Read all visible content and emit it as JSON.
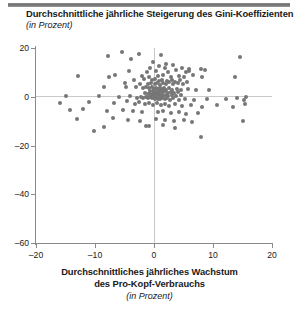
{
  "figure": {
    "title": "Durchschnittliche jährliche Steigerung des Gini-Koeffizienten",
    "subtitle": "(in Prozent)",
    "x_caption_line1": "Durchschnittliches jährliches Wachstum",
    "x_caption_line2": "des Pro-Kopf-Verbrauchs",
    "x_caption_sub": "(in Prozent)",
    "dot_color": "#767676",
    "axis_color": "#8a8a8a",
    "zero_line_color": "#c9c9c9",
    "rule_color": "#6f6f6f"
  },
  "chart_data": {
    "type": "scatter",
    "title": "Durchschnittliche jährliche Steigerung des Gini-Koeffizienten",
    "subtitle": "(in Prozent)",
    "xlabel": "Durchschnittliches jährliches Wachstum des Pro-Kopf-Verbrauchs (in Prozent)",
    "ylabel": "Durchschnittliche jährliche Steigerung des Gini-Koeffizienten (in Prozent)",
    "xlim": [
      -20,
      20
    ],
    "ylim": [
      -60,
      20
    ],
    "xticks": [
      -20,
      -10,
      0,
      10,
      20
    ],
    "yticks": [
      20,
      0,
      -20,
      -40,
      -60
    ],
    "xtick_labels": [
      "-20",
      "-10",
      "0",
      "10",
      "20"
    ],
    "ytick_labels": [
      "20",
      "0",
      "-20",
      "-40",
      "-60"
    ],
    "grid": false,
    "zero_reference_lines": {
      "x": 0,
      "y": 0
    },
    "legend": null,
    "marker": {
      "shape": "circle",
      "size": 4,
      "color": "#767676"
    },
    "n_points": 171,
    "points": [
      [
        -5.4,
        18.2
      ],
      [
        -2.6,
        17.6
      ],
      [
        -7.8,
        16.9
      ],
      [
        1.2,
        17.2
      ],
      [
        14.6,
        16.4
      ],
      [
        -3.9,
        15.4
      ],
      [
        -0.2,
        14.4
      ],
      [
        2.1,
        13.6
      ],
      [
        3.3,
        13.1
      ],
      [
        0.9,
        12.5
      ],
      [
        1.8,
        11.9
      ],
      [
        -0.6,
        11.6
      ],
      [
        4.7,
        11.8
      ],
      [
        6.0,
        11.2
      ],
      [
        7.9,
        11.4
      ],
      [
        8.6,
        11.1
      ],
      [
        -4.3,
        10.4
      ],
      [
        -1.2,
        10.2
      ],
      [
        0.3,
        10.6
      ],
      [
        2.4,
        10.3
      ],
      [
        3.8,
        10.8
      ],
      [
        5.4,
        10.1
      ],
      [
        5.9,
        10.6
      ],
      [
        -6.6,
        9.1
      ],
      [
        -12.8,
        8.4
      ],
      [
        -7.6,
        8.0
      ],
      [
        -2.0,
        8.6
      ],
      [
        -0.9,
        8.2
      ],
      [
        0.6,
        8.4
      ],
      [
        1.5,
        8.9
      ],
      [
        2.8,
        8.1
      ],
      [
        4.2,
        8.6
      ],
      [
        5.1,
        8.0
      ],
      [
        6.6,
        8.8
      ],
      [
        8.2,
        8.2
      ],
      [
        13.8,
        8.1
      ],
      [
        -3.4,
        6.9
      ],
      [
        -1.7,
        7.2
      ],
      [
        -0.4,
        6.8
      ],
      [
        0.2,
        7.4
      ],
      [
        0.8,
        6.6
      ],
      [
        1.4,
        7.0
      ],
      [
        2.2,
        6.4
      ],
      [
        3.0,
        6.9
      ],
      [
        3.6,
        6.2
      ],
      [
        4.4,
        6.7
      ],
      [
        5.6,
        6.1
      ],
      [
        -5.0,
        5.6
      ],
      [
        -2.3,
        5.2
      ],
      [
        -1.0,
        5.4
      ],
      [
        -0.5,
        5.8
      ],
      [
        0.1,
        5.1
      ],
      [
        0.5,
        5.5
      ],
      [
        1.0,
        5.0
      ],
      [
        1.6,
        5.6
      ],
      [
        2.0,
        5.3
      ],
      [
        2.6,
        5.9
      ],
      [
        3.2,
        5.2
      ],
      [
        4.0,
        5.6
      ],
      [
        4.9,
        5.1
      ],
      [
        -8.5,
        4.2
      ],
      [
        -4.8,
        3.8
      ],
      [
        -3.1,
        4.0
      ],
      [
        -1.9,
        3.6
      ],
      [
        -1.3,
        4.2
      ],
      [
        -0.8,
        3.4
      ],
      [
        -0.3,
        3.9
      ],
      [
        0.0,
        3.2
      ],
      [
        0.4,
        3.7
      ],
      [
        0.7,
        3.1
      ],
      [
        1.1,
        3.6
      ],
      [
        1.3,
        3.0
      ],
      [
        1.7,
        3.5
      ],
      [
        2.1,
        2.9
      ],
      [
        2.5,
        3.4
      ],
      [
        3.1,
        2.8
      ],
      [
        3.9,
        3.3
      ],
      [
        4.6,
        2.7
      ],
      [
        5.8,
        3.2
      ],
      [
        7.2,
        2.6
      ],
      [
        9.4,
        2.8
      ],
      [
        -0.6,
        2.2
      ],
      [
        -0.2,
        2.4
      ],
      [
        0.2,
        2.0
      ],
      [
        0.6,
        2.5
      ],
      [
        0.9,
        1.9
      ],
      [
        1.2,
        2.3
      ],
      [
        1.5,
        1.8
      ],
      [
        1.9,
        2.2
      ],
      [
        2.3,
        1.7
      ],
      [
        2.8,
        2.1
      ],
      [
        3.4,
        1.6
      ],
      [
        4.1,
        2.0
      ],
      [
        -1.5,
        1.4
      ],
      [
        -1.1,
        1.0
      ],
      [
        -0.7,
        1.3
      ],
      [
        -0.4,
        0.9
      ],
      [
        -0.1,
        1.2
      ],
      [
        0.1,
        0.8
      ],
      [
        0.3,
        1.1
      ],
      [
        0.5,
        0.7
      ],
      [
        0.8,
        1.0
      ],
      [
        1.0,
        0.6
      ],
      [
        1.3,
        0.9
      ],
      [
        1.6,
        0.5
      ],
      [
        2.0,
        0.8
      ],
      [
        2.4,
        0.4
      ],
      [
        3.0,
        0.7
      ],
      [
        3.7,
        0.3
      ],
      [
        4.5,
        0.6
      ],
      [
        -15.0,
        0.2
      ],
      [
        -9.3,
        0.4
      ],
      [
        -5.9,
        -0.2
      ],
      [
        -4.0,
        0.3
      ],
      [
        -2.8,
        -0.4
      ],
      [
        -2.2,
        0.1
      ],
      [
        -1.8,
        -0.6
      ],
      [
        -1.4,
        -0.1
      ],
      [
        -1.0,
        -0.5
      ],
      [
        -0.6,
        0.0
      ],
      [
        -0.3,
        -0.7
      ],
      [
        0.0,
        -0.2
      ],
      [
        0.2,
        -0.8
      ],
      [
        0.4,
        -0.3
      ],
      [
        0.7,
        -0.9
      ],
      [
        0.9,
        -0.4
      ],
      [
        1.1,
        -1.0
      ],
      [
        1.4,
        -0.5
      ],
      [
        1.8,
        -1.1
      ],
      [
        2.2,
        -0.6
      ],
      [
        2.7,
        -1.2
      ],
      [
        3.3,
        -0.7
      ],
      [
        4.2,
        -1.3
      ],
      [
        5.3,
        -0.8
      ],
      [
        6.8,
        -1.4
      ],
      [
        9.0,
        -0.9
      ],
      [
        12.2,
        -1.1
      ],
      [
        14.0,
        -0.6
      ],
      [
        15.2,
        -1.3
      ],
      [
        15.6,
        0.1
      ],
      [
        -16.0,
        -2.6
      ],
      [
        -11.0,
        -2.0
      ],
      [
        -6.8,
        -2.4
      ],
      [
        -4.6,
        -1.9
      ],
      [
        -3.3,
        -2.8
      ],
      [
        -2.5,
        -2.2
      ],
      [
        -1.6,
        -3.0
      ],
      [
        -0.9,
        -2.5
      ],
      [
        -0.2,
        -3.2
      ],
      [
        0.5,
        -2.7
      ],
      [
        1.2,
        -3.4
      ],
      [
        1.9,
        -2.9
      ],
      [
        2.6,
        -3.6
      ],
      [
        3.5,
        -3.1
      ],
      [
        4.8,
        -3.8
      ],
      [
        6.2,
        -3.3
      ],
      [
        8.1,
        -4.0
      ],
      [
        10.6,
        -3.5
      ],
      [
        13.4,
        -4.2
      ],
      [
        15.4,
        -3.0
      ],
      [
        -14.2,
        -5.6
      ],
      [
        -12.0,
        -5.1
      ],
      [
        -8.0,
        -5.8
      ],
      [
        -5.2,
        -5.3
      ],
      [
        -3.6,
        -6.0
      ],
      [
        -2.0,
        -6.4
      ],
      [
        0.6,
        -6.2
      ],
      [
        1.6,
        -5.8
      ],
      [
        2.9,
        -6.6
      ],
      [
        4.3,
        -6.1
      ],
      [
        5.5,
        -7.0
      ],
      [
        7.4,
        -6.5
      ],
      [
        -13.0,
        -9.0
      ],
      [
        -7.0,
        -8.6
      ],
      [
        -4.4,
        -9.4
      ],
      [
        -2.4,
        -9.8
      ],
      [
        0.4,
        -9.2
      ],
      [
        1.9,
        -9.6
      ],
      [
        3.4,
        -10.0
      ],
      [
        5.0,
        -9.4
      ],
      [
        6.4,
        -10.4
      ],
      [
        15.0,
        -9.8
      ],
      [
        -8.4,
        -12.6
      ],
      [
        -1.4,
        -12.2
      ],
      [
        3.6,
        -12.8
      ],
      [
        -10.2,
        -14.0
      ],
      [
        8.0,
        -16.4
      ],
      [
        1.5,
        -11.4
      ],
      [
        -0.8,
        -12.0
      ]
    ]
  }
}
